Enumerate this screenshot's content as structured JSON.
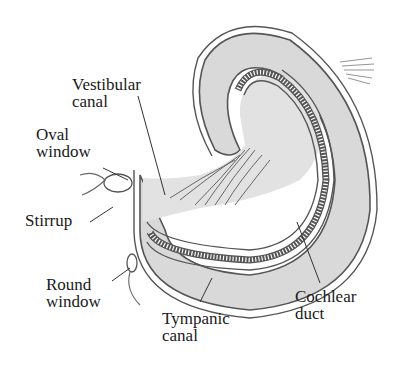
{
  "diagram": {
    "colors": {
      "fill": "#d9d9d9",
      "stroke": "#555555",
      "text": "#1a1a1a",
      "background": "#ffffff"
    },
    "labels": {
      "vestibular_canal_line1": "Vestibular",
      "vestibular_canal_line2": "canal",
      "oval_window_line1": "Oval",
      "oval_window_line2": "window",
      "stirrup": "Stirrup",
      "round_window_line1": "Round",
      "round_window_line2": "window",
      "tympanic_canal_line1": "Tympanic",
      "tympanic_canal_line2": "canal",
      "cochlear_duct_line1": "Cochlear",
      "cochlear_duct_line2": "duct"
    }
  }
}
